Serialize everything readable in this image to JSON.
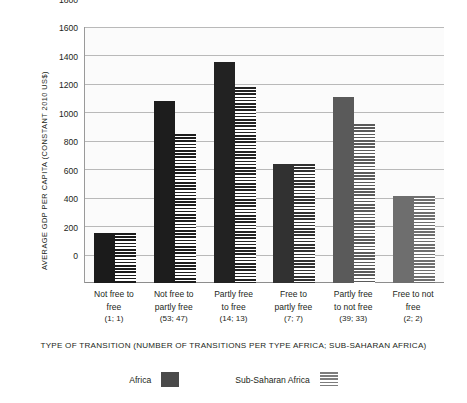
{
  "chart_data": {
    "type": "bar",
    "title": "",
    "xlabel": "TYPE OF TRANSITION (NUMBER OF TRANSITIONS PER TYPE AFRICA; SUB-SAHARAN AFRICA)",
    "ylabel": "AVERAGE GDP PER CAPITA (CONSTANT 2010 US$)",
    "ylim": [
      0,
      1800
    ],
    "yticks": [
      0,
      200,
      400,
      600,
      800,
      1000,
      1200,
      1400,
      1600,
      1800
    ],
    "ytick_labels": [
      "0",
      "200",
      "400",
      "600",
      "800",
      "1000",
      "1200",
      "1400",
      "1600",
      "1800"
    ],
    "grid": true,
    "legend_position": "bottom",
    "categories": [
      "Not free to free (1; 1)",
      "Not free to partly free (53; 47)",
      "Partly free to free (14; 13)",
      "Free to partly free (7; 7)",
      "Partly free to not free (39; 33)",
      "Free to not free (2; 2)"
    ],
    "category_lines": [
      [
        "Not free to",
        "free",
        "(1; 1)"
      ],
      [
        "Not free to",
        "partly free",
        "(53; 47)"
      ],
      [
        "Partly free",
        "to free",
        "(14; 13)"
      ],
      [
        "Free to",
        "partly free",
        "(7; 7)"
      ],
      [
        "Partly free",
        "to not free",
        "(39; 33)"
      ],
      [
        "Free to not",
        "free",
        "(2; 2)"
      ]
    ],
    "series": [
      {
        "name": "Africa",
        "style": "solid",
        "values": [
          352,
          1280,
          1555,
          835,
          1310,
          615
        ]
      },
      {
        "name": "Sub-Saharan Africa",
        "style": "striped",
        "values": [
          352,
          1045,
          1375,
          835,
          1120,
          615
        ]
      }
    ],
    "bar_colors": [
      "#1b1b1b",
      "#1d1d1d",
      "#222222",
      "#313131",
      "#5a5a5a",
      "#6e6e6e"
    ]
  },
  "legend": {
    "items": [
      {
        "label": "Africa",
        "style": "solid",
        "color": "#4a4a4a"
      },
      {
        "label": "Sub-Saharan Africa",
        "style": "striped",
        "color": "#7d7d7d"
      }
    ]
  }
}
